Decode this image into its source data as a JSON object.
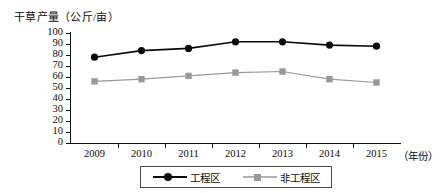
{
  "chart_data": {
    "type": "line",
    "title": "",
    "ylabel": "干草产量（公斤/亩）",
    "xlabel": "（年份）",
    "categories": [
      "2009",
      "2010",
      "2011",
      "2012",
      "2013",
      "2014",
      "2015"
    ],
    "ylim": [
      0,
      100
    ],
    "yticks": [
      0,
      10,
      20,
      30,
      40,
      50,
      60,
      70,
      80,
      90,
      100
    ],
    "grid": false,
    "legend_position": "bottom",
    "series": [
      {
        "name": "工程区",
        "color": "#0b0b0b",
        "marker": "circle",
        "values": [
          78,
          84,
          86,
          92,
          92,
          89,
          88
        ]
      },
      {
        "name": "非工程区",
        "color": "#999999",
        "marker": "square",
        "values": [
          56,
          58,
          61,
          64,
          65,
          58,
          55
        ]
      }
    ]
  },
  "axes": {
    "y_title": "干草产量（公斤/亩）",
    "x_unit": "（年份）",
    "y_tick_labels": [
      "100",
      "90",
      "80",
      "70",
      "60",
      "50",
      "40",
      "30",
      "20",
      "10",
      "0"
    ],
    "x_tick_labels": [
      "2009",
      "2010",
      "2011",
      "2012",
      "2013",
      "2014",
      "2015"
    ]
  },
  "legend": {
    "items": [
      {
        "label": "工程区",
        "color": "#0b0b0b",
        "marker": "circle"
      },
      {
        "label": "非工程区",
        "color": "#999999",
        "marker": "square"
      }
    ]
  }
}
